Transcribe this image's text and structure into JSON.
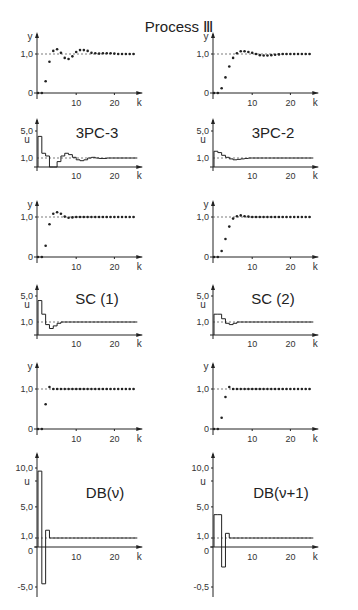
{
  "title": "Process Ⅲ",
  "chart_data": [
    {
      "type": "scatter",
      "id": "y-3pc3",
      "title": "",
      "xlabel": "k",
      "ylabel": "y",
      "xlim": [
        0,
        26
      ],
      "ylim": [
        0,
        1.2
      ],
      "xticks": [
        "10",
        "20"
      ],
      "yticks": [
        "0",
        "1,0"
      ],
      "reference": 1.0,
      "x": [
        0,
        1,
        2,
        3,
        4,
        5,
        6,
        7,
        8,
        9,
        10,
        11,
        12,
        13,
        14,
        15,
        16,
        17,
        18,
        19,
        20,
        21,
        22,
        23,
        24,
        25
      ],
      "values": [
        0,
        0,
        0.3,
        0.8,
        1.08,
        1.12,
        1.03,
        0.9,
        0.87,
        0.94,
        1.05,
        1.1,
        1.1,
        1.08,
        1.03,
        1.02,
        1.01,
        1.02,
        1.02,
        1.02,
        1.01,
        1.0,
        1.0,
        1.0,
        1.0,
        1.0
      ]
    },
    {
      "type": "scatter",
      "id": "y-3pc2",
      "title": "",
      "xlabel": "k",
      "ylabel": "y",
      "xlim": [
        0,
        26
      ],
      "ylim": [
        0,
        1.2
      ],
      "xticks": [
        "10",
        "20"
      ],
      "yticks": [
        "0",
        "1,0"
      ],
      "reference": 1.0,
      "x": [
        0,
        1,
        2,
        3,
        4,
        5,
        6,
        7,
        8,
        9,
        10,
        11,
        12,
        13,
        14,
        15,
        16,
        17,
        18,
        19,
        20,
        21,
        22,
        23,
        24,
        25
      ],
      "values": [
        0,
        0,
        0.12,
        0.4,
        0.68,
        0.9,
        1.02,
        1.07,
        1.07,
        1.05,
        1.03,
        1.0,
        0.97,
        0.96,
        0.96,
        0.97,
        0.98,
        0.99,
        1.0,
        1.0,
        1.0,
        1.0,
        1.0,
        1.0,
        1.0,
        1.0
      ]
    },
    {
      "type": "line",
      "id": "u-3pc3",
      "title": "3PC-3",
      "xlabel": "k",
      "ylabel": "u",
      "xlim": [
        0,
        26
      ],
      "ylim": [
        0,
        5.5
      ],
      "xticks": [
        "10",
        "20"
      ],
      "yticks": [
        "1,0",
        "5,0"
      ],
      "reference": 1.0,
      "step": true,
      "x": [
        0,
        1,
        2,
        3,
        4,
        5,
        6,
        7,
        8,
        9,
        10,
        11,
        12,
        13,
        14,
        15,
        16,
        17,
        18,
        19,
        20,
        21,
        22,
        23,
        24,
        25
      ],
      "values": [
        4.2,
        1.7,
        1.3,
        0.0,
        0.0,
        0.6,
        1.3,
        1.7,
        1.5,
        1.1,
        0.8,
        0.7,
        0.8,
        1.0,
        1.1,
        1.0,
        0.95,
        0.95,
        1.0,
        1.0,
        1.0,
        1.0,
        1.0,
        1.0,
        1.0,
        1.0
      ]
    },
    {
      "type": "line",
      "id": "u-3pc2",
      "title": "3PC-2",
      "xlabel": "k",
      "ylabel": "u",
      "xlim": [
        0,
        26
      ],
      "ylim": [
        0,
        5.5
      ],
      "xticks": [
        "10",
        "20"
      ],
      "yticks": [
        "1,0",
        "5,0"
      ],
      "reference": 1.0,
      "step": true,
      "x": [
        0,
        1,
        2,
        3,
        4,
        5,
        6,
        7,
        8,
        9,
        10,
        11,
        12,
        13,
        14,
        15,
        16,
        17,
        18,
        19,
        20,
        21,
        22,
        23,
        24,
        25
      ],
      "values": [
        2.0,
        1.8,
        1.4,
        1.1,
        0.9,
        0.8,
        0.85,
        0.9,
        0.95,
        1.0,
        1.0,
        1.0,
        1.0,
        1.0,
        1.0,
        1.0,
        1.0,
        1.0,
        1.0,
        1.0,
        1.0,
        1.0,
        1.0,
        1.0,
        1.0,
        1.0
      ]
    },
    {
      "type": "scatter",
      "id": "y-sc1",
      "title": "",
      "xlabel": "k",
      "ylabel": "y",
      "xlim": [
        0,
        26
      ],
      "ylim": [
        0,
        1.2
      ],
      "xticks": [
        "10",
        "20"
      ],
      "yticks": [
        "0",
        "1,0"
      ],
      "reference": 1.0,
      "x": [
        0,
        1,
        2,
        3,
        4,
        5,
        6,
        7,
        8,
        9,
        10,
        11,
        12,
        13,
        14,
        15,
        16,
        17,
        18,
        19,
        20,
        21,
        22,
        23,
        24,
        25
      ],
      "values": [
        0,
        0,
        0.28,
        0.82,
        1.08,
        1.12,
        1.08,
        1.01,
        0.98,
        0.99,
        1.0,
        1.0,
        1.0,
        1.0,
        1.0,
        1.0,
        1.0,
        1.0,
        1.0,
        1.0,
        1.0,
        1.0,
        1.0,
        1.0,
        1.0,
        1.0
      ]
    },
    {
      "type": "scatter",
      "id": "y-sc2",
      "title": "",
      "xlabel": "k",
      "ylabel": "y",
      "xlim": [
        0,
        26
      ],
      "ylim": [
        0,
        1.2
      ],
      "xticks": [
        "10",
        "20"
      ],
      "yticks": [
        "0",
        "1,0"
      ],
      "reference": 1.0,
      "x": [
        0,
        1,
        2,
        3,
        4,
        5,
        6,
        7,
        8,
        9,
        10,
        11,
        12,
        13,
        14,
        15,
        16,
        17,
        18,
        19,
        20,
        21,
        22,
        23,
        24,
        25
      ],
      "values": [
        0,
        0,
        0.15,
        0.45,
        0.76,
        0.96,
        1.02,
        1.04,
        1.02,
        1.01,
        1.0,
        1.0,
        1.0,
        1.0,
        1.0,
        1.0,
        1.0,
        1.0,
        1.0,
        1.0,
        1.0,
        1.0,
        1.0,
        1.0,
        1.0,
        1.0
      ]
    },
    {
      "type": "line",
      "id": "u-sc1",
      "title": "SC (1)",
      "xlabel": "k",
      "ylabel": "u",
      "xlim": [
        0,
        26
      ],
      "ylim": [
        0,
        5.5
      ],
      "xticks": [
        "10",
        "20"
      ],
      "yticks": [
        "1,0",
        "5,0"
      ],
      "reference": 1.0,
      "step": true,
      "x": [
        0,
        1,
        2,
        3,
        4,
        5,
        6,
        7,
        8,
        9,
        10,
        11,
        12,
        13,
        14,
        15,
        16,
        17,
        18,
        19,
        20,
        21,
        22,
        23,
        24,
        25
      ],
      "values": [
        4.3,
        2.2,
        0.8,
        0.5,
        0.7,
        0.9,
        1.0,
        1.0,
        1.0,
        1.0,
        1.0,
        1.0,
        1.0,
        1.0,
        1.0,
        1.0,
        1.0,
        1.0,
        1.0,
        1.0,
        1.0,
        1.0,
        1.0,
        1.0,
        1.0,
        1.0
      ]
    },
    {
      "type": "line",
      "id": "u-sc2",
      "title": "SC (2)",
      "xlabel": "k",
      "ylabel": "u",
      "xlim": [
        0,
        26
      ],
      "ylim": [
        0,
        5.5
      ],
      "xticks": [
        "10",
        "20"
      ],
      "yticks": [
        "1,0",
        "5,0"
      ],
      "reference": 1.0,
      "step": true,
      "x": [
        0,
        1,
        2,
        3,
        4,
        5,
        6,
        7,
        8,
        9,
        10,
        11,
        12,
        13,
        14,
        15,
        16,
        17,
        18,
        19,
        20,
        21,
        22,
        23,
        24,
        25
      ],
      "values": [
        2.2,
        2.2,
        1.5,
        0.9,
        0.8,
        0.9,
        1.0,
        1.0,
        1.0,
        1.0,
        1.0,
        1.0,
        1.0,
        1.0,
        1.0,
        1.0,
        1.0,
        1.0,
        1.0,
        1.0,
        1.0,
        1.0,
        1.0,
        1.0,
        1.0,
        1.0
      ]
    },
    {
      "type": "scatter",
      "id": "y-db-nu",
      "title": "",
      "xlabel": "k",
      "ylabel": "y",
      "xlim": [
        0,
        26
      ],
      "ylim": [
        0,
        1.2
      ],
      "xticks": [
        "10",
        "20"
      ],
      "yticks": [
        "0",
        "1,0"
      ],
      "reference": 1.0,
      "x": [
        0,
        1,
        2,
        3,
        4,
        5,
        6,
        7,
        8,
        9,
        10,
        11,
        12,
        13,
        14,
        15,
        16,
        17,
        18,
        19,
        20,
        21,
        22,
        23,
        24,
        25
      ],
      "values": [
        0,
        0,
        0.62,
        1.05,
        1.0,
        1.0,
        1.0,
        1.0,
        1.0,
        1.0,
        1.0,
        1.0,
        1.0,
        1.0,
        1.0,
        1.0,
        1.0,
        1.0,
        1.0,
        1.0,
        1.0,
        1.0,
        1.0,
        1.0,
        1.0,
        1.0
      ]
    },
    {
      "type": "scatter",
      "id": "y-db-nu1",
      "title": "",
      "xlabel": "k",
      "ylabel": "y",
      "xlim": [
        0,
        26
      ],
      "ylim": [
        0,
        1.2
      ],
      "xticks": [
        "10",
        "20"
      ],
      "yticks": [
        "0",
        "1,0"
      ],
      "reference": 1.0,
      "x": [
        0,
        1,
        2,
        3,
        4,
        5,
        6,
        7,
        8,
        9,
        10,
        11,
        12,
        13,
        14,
        15,
        16,
        17,
        18,
        19,
        20,
        21,
        22,
        23,
        24,
        25
      ],
      "values": [
        0,
        0,
        0.28,
        0.8,
        1.05,
        1.0,
        1.0,
        1.0,
        1.0,
        1.0,
        1.0,
        1.0,
        1.0,
        1.0,
        1.0,
        1.0,
        1.0,
        1.0,
        1.0,
        1.0,
        1.0,
        1.0,
        1.0,
        1.0,
        1.0,
        1.0
      ]
    },
    {
      "type": "line",
      "id": "u-db-nu",
      "title": "DB(ν)",
      "xlabel": "k",
      "ylabel": "u",
      "xlim": [
        0,
        26
      ],
      "ylim": [
        -5.5,
        11
      ],
      "xticks": [
        "10",
        "20"
      ],
      "yticks": [
        "-5,0",
        "0",
        "1,0",
        "5,0",
        "10,0"
      ],
      "reference": 1.0,
      "step": true,
      "x": [
        0,
        1,
        2,
        3,
        4,
        5,
        6,
        7,
        8,
        9,
        10,
        11,
        12,
        13,
        14,
        15,
        16,
        17,
        18,
        19,
        20,
        21,
        22,
        23,
        24,
        25
      ],
      "values": [
        9.6,
        -4.6,
        2.0,
        1.0,
        1.0,
        1.0,
        1.0,
        1.0,
        1.0,
        1.0,
        1.0,
        1.0,
        1.0,
        1.0,
        1.0,
        1.0,
        1.0,
        1.0,
        1.0,
        1.0,
        1.0,
        1.0,
        1.0,
        1.0,
        1.0,
        1.0
      ]
    },
    {
      "type": "line",
      "id": "u-db-nu1",
      "title": "DB(ν+1)",
      "xlabel": "k",
      "ylabel": "u",
      "xlim": [
        0,
        26
      ],
      "ylim": [
        -5.5,
        11
      ],
      "xticks": [
        "10",
        "20"
      ],
      "yticks": [
        "-0,5",
        "0",
        "1,0",
        "5,0",
        "10,0"
      ],
      "reference": 1.0,
      "step": true,
      "x": [
        0,
        1,
        2,
        3,
        4,
        5,
        6,
        7,
        8,
        9,
        10,
        11,
        12,
        13,
        14,
        15,
        16,
        17,
        18,
        19,
        20,
        21,
        22,
        23,
        24,
        25
      ],
      "values": [
        4.0,
        4.0,
        -2.5,
        1.6,
        1.0,
        1.0,
        1.0,
        1.0,
        1.0,
        1.0,
        1.0,
        1.0,
        1.0,
        1.0,
        1.0,
        1.0,
        1.0,
        1.0,
        1.0,
        1.0,
        1.0,
        1.0,
        1.0,
        1.0,
        1.0,
        1.0
      ]
    }
  ]
}
